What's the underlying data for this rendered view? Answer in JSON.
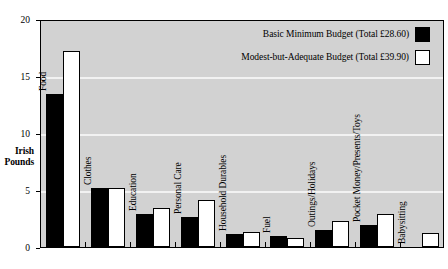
{
  "chart_data": {
    "type": "bar",
    "title": "",
    "xlabel": "",
    "ylabel": "Irish Pounds",
    "ylim": [
      0,
      20
    ],
    "yticks": [
      0,
      5,
      10,
      15,
      20
    ],
    "ytick_labels": [
      "0",
      "5",
      "10",
      "15",
      "20"
    ],
    "grid": true,
    "gridlines_at": [
      5,
      10,
      15
    ],
    "legend_position": "top-right",
    "categories": [
      "Food",
      "Clothes",
      "Education",
      "Personal Care",
      "Household Durables",
      "Fuel",
      "Outings/Holidays",
      "Pocket Money/Presents/Toys",
      "Babysitting"
    ],
    "series": [
      {
        "name": "Basic Minimum Budget (Total £28.60)",
        "color": "#000000",
        "values": [
          13.4,
          5.2,
          2.9,
          2.6,
          1.1,
          1.0,
          1.5,
          1.9,
          0
        ]
      },
      {
        "name": "Modest-but-Adequate Budget (Total £39.90)",
        "color": "#ffffff",
        "values": [
          17.2,
          5.2,
          3.4,
          4.1,
          1.3,
          0.8,
          2.3,
          2.9,
          1.2
        ]
      }
    ]
  },
  "axis": {
    "y_title_line1": "Irish",
    "y_title_line2": "Pounds"
  },
  "legend": {
    "items": [
      {
        "label": "Basic Minimum Budget (Total £28.60)",
        "swatch": "black"
      },
      {
        "label": "Modest-but-Adequate Budget (Total £39.90)",
        "swatch": "white"
      }
    ]
  }
}
